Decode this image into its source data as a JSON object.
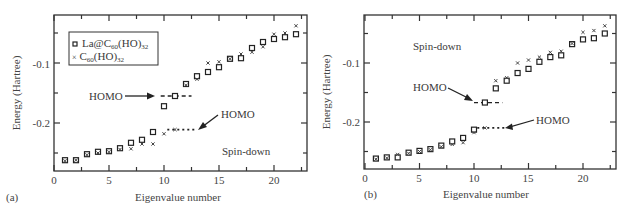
{
  "chart_data": [
    {
      "type": "scatter",
      "panel_label": "(a)",
      "xlabel": "Eigenvalue number",
      "ylabel": "Energy (Hartree)",
      "xlim": [
        0,
        23
      ],
      "ylim": [
        -0.28,
        -0.02
      ],
      "xticks": [
        0,
        5,
        10,
        15,
        20
      ],
      "yticks": [
        -0.1,
        -0.2
      ],
      "yticks_minor": [
        -0.05,
        -0.15,
        -0.25
      ],
      "legend": [
        "La@C60(HO)32",
        "× C60(HO)32"
      ],
      "annotations": [
        "HOMO",
        "HOMO",
        "Spin-down"
      ],
      "series": [
        {
          "name": "La@C60(HO)32",
          "marker": "square",
          "x": [
            1,
            2,
            3,
            4,
            5,
            6,
            7,
            8,
            9,
            10,
            11,
            12,
            13,
            14,
            15,
            16,
            17,
            18,
            19,
            20,
            21,
            22
          ],
          "y": [
            -0.262,
            -0.262,
            -0.252,
            -0.248,
            -0.247,
            -0.242,
            -0.233,
            -0.228,
            -0.215,
            -0.172,
            -0.155,
            -0.135,
            -0.122,
            -0.115,
            -0.107,
            -0.093,
            -0.092,
            -0.075,
            -0.065,
            -0.06,
            -0.057,
            -0.052
          ]
        },
        {
          "name": "C60(HO)32",
          "marker": "cross",
          "x": [
            1,
            2,
            3,
            4,
            5,
            6,
            7,
            8,
            9,
            10,
            11,
            12,
            13,
            14,
            15,
            16,
            17,
            18,
            19,
            20,
            21,
            22
          ],
          "y": [
            -0.263,
            -0.262,
            -0.253,
            -0.25,
            -0.248,
            -0.244,
            -0.243,
            -0.235,
            -0.235,
            -0.218,
            -0.211,
            -0.137,
            -0.127,
            -0.1,
            -0.098,
            -0.093,
            -0.085,
            -0.082,
            -0.073,
            -0.052,
            -0.05,
            -0.038
          ]
        }
      ],
      "homo_lines": [
        {
          "series": "La@C60(HO)32",
          "y": -0.155,
          "x_from": 9.7,
          "x_to": 12.5,
          "style": "dashed"
        },
        {
          "series": "C60(HO)32",
          "y": -0.211,
          "x_from": 10.3,
          "x_to": 13.0,
          "style": "dotted"
        }
      ]
    },
    {
      "type": "scatter",
      "panel_label": "(b)",
      "xlabel": "Eigenvalue number",
      "ylabel": "Energy (Hartree)",
      "xlim": [
        0,
        23
      ],
      "ylim": [
        -0.28,
        -0.02
      ],
      "xticks": [
        0,
        5,
        10,
        15,
        20
      ],
      "yticks": [
        -0.1,
        -0.2
      ],
      "yticks_minor": [
        -0.05,
        -0.15,
        -0.25
      ],
      "annotations": [
        "Spin-down",
        "HOMO",
        "HOMO"
      ],
      "series": [
        {
          "name": "La@C60(HO)32",
          "marker": "square",
          "x": [
            1,
            2,
            3,
            4,
            5,
            6,
            7,
            8,
            9,
            10,
            11,
            12,
            13,
            14,
            15,
            16,
            17,
            18,
            19,
            20,
            21,
            22
          ],
          "y": [
            -0.262,
            -0.26,
            -0.26,
            -0.252,
            -0.249,
            -0.246,
            -0.24,
            -0.233,
            -0.227,
            -0.213,
            -0.167,
            -0.143,
            -0.13,
            -0.117,
            -0.11,
            -0.098,
            -0.09,
            -0.087,
            -0.068,
            -0.06,
            -0.058,
            -0.05
          ]
        },
        {
          "name": "C60(HO)32",
          "marker": "cross",
          "x": [
            1,
            2,
            3,
            4,
            5,
            6,
            7,
            8,
            9,
            10,
            11,
            12,
            13,
            14,
            15,
            16,
            17,
            18,
            19,
            20,
            21,
            22
          ],
          "y": [
            -0.263,
            -0.261,
            -0.255,
            -0.253,
            -0.25,
            -0.247,
            -0.242,
            -0.238,
            -0.235,
            -0.218,
            -0.21,
            -0.13,
            -0.125,
            -0.1,
            -0.095,
            -0.09,
            -0.082,
            -0.08,
            -0.067,
            -0.048,
            -0.045,
            -0.037
          ]
        }
      ],
      "homo_lines": [
        {
          "series": "La@C60(HO)32",
          "y": -0.167,
          "x_from": 10.0,
          "x_to": 12.6,
          "style": "dashed"
        },
        {
          "series": "C60(HO)32",
          "y": -0.21,
          "x_from": 10.3,
          "x_to": 12.9,
          "style": "dotted"
        }
      ]
    }
  ],
  "panels": [
    {
      "label": "(a)",
      "xlabel": "Eigenvalue number",
      "ylabel": "Energy (Hartree)",
      "xtick_labels": [
        "0",
        "5",
        "10",
        "15",
        "20"
      ],
      "ytick_labels": [
        "-0.1",
        "-0.2"
      ],
      "legend": {
        "item1": "La@C",
        "item1_sub1": "60",
        "item1_mid": "(HO)",
        "item1_sub2": "32",
        "item2_prefix": "×",
        "item2": "C",
        "item2_sub1": "60",
        "item2_mid": "(HO)",
        "item2_sub2": "32"
      },
      "homo_label_1": "HOMO",
      "homo_label_2": "HOMO",
      "spin_label": "Spin-down"
    },
    {
      "label": "(b)",
      "xlabel": "Eigenvalue number",
      "ylabel": "Energy (Hartree)",
      "xtick_labels": [
        "0",
        "5",
        "10",
        "15",
        "20"
      ],
      "ytick_labels": [
        "-0.1",
        "-0.2"
      ],
      "homo_label_1": "HOMO",
      "homo_label_2": "HOMO",
      "spin_label": "Spin-down"
    }
  ]
}
